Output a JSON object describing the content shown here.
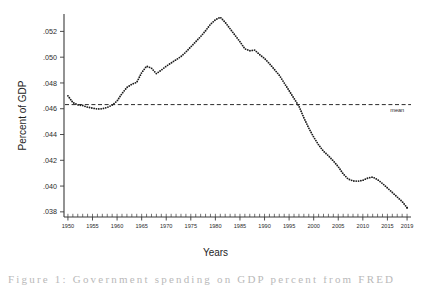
{
  "chart_data": {
    "type": "scatter",
    "title": "",
    "xlabel": "Years",
    "ylabel": "Percent of GDP",
    "xlim": [
      1949.2,
      2019.8
    ],
    "ylim": [
      0.0376,
      0.05335
    ],
    "grid": false,
    "legend": "none",
    "marker_style": "dotted-line",
    "x_tick_labels": [
      "1950",
      "1955",
      "1960",
      "1965",
      "1970",
      "1975",
      "1980",
      "1985",
      "1990",
      "1995",
      "2000",
      "2005",
      "2010",
      "2015",
      "2019"
    ],
    "x_tick_values": [
      1950,
      1955,
      1960,
      1965,
      1970,
      1975,
      1980,
      1985,
      1990,
      1995,
      2000,
      2005,
      2010,
      2015,
      2019
    ],
    "x_minor_tick_step": 1,
    "y_tick_labels": [
      ".038",
      ".040",
      ".042",
      ".044",
      ".046",
      ".048",
      ".050",
      ".052"
    ],
    "y_tick_values": [
      0.038,
      0.04,
      0.042,
      0.044,
      0.046,
      0.048,
      0.05,
      0.052
    ],
    "annotations": [
      {
        "name": "mean",
        "label": "mean",
        "type": "hline",
        "value": 0.04632,
        "x_label_pos": 2017
      }
    ],
    "series": [
      {
        "name": "Percent of GDP",
        "x": [
          1950,
          1951,
          1952,
          1953,
          1954,
          1955,
          1956,
          1957,
          1958,
          1959,
          1960,
          1961,
          1962,
          1963,
          1964,
          1965,
          1966,
          1967,
          1968,
          1969,
          1970,
          1971,
          1972,
          1973,
          1974,
          1975,
          1976,
          1977,
          1978,
          1979,
          1980,
          1981,
          1982,
          1983,
          1984,
          1985,
          1986,
          1987,
          1988,
          1989,
          1990,
          1991,
          1992,
          1993,
          1994,
          1995,
          1996,
          1997,
          1998,
          1999,
          2000,
          2001,
          2002,
          2003,
          2004,
          2005,
          2006,
          2007,
          2008,
          2009,
          2010,
          2011,
          2012,
          2013,
          2014,
          2015,
          2016,
          2017,
          2018,
          2019
        ],
        "values": [
          0.047,
          0.04648,
          0.0463,
          0.04625,
          0.04612,
          0.04605,
          0.04598,
          0.046,
          0.0461,
          0.04628,
          0.0466,
          0.04718,
          0.04765,
          0.0479,
          0.04805,
          0.0488,
          0.0493,
          0.04915,
          0.04872,
          0.049,
          0.0493,
          0.04955,
          0.0498,
          0.05005,
          0.0504,
          0.0508,
          0.0512,
          0.0516,
          0.05205,
          0.05255,
          0.0529,
          0.0531,
          0.0527,
          0.0522,
          0.0517,
          0.0512,
          0.05065,
          0.0505,
          0.05055,
          0.0502,
          0.0499,
          0.0495,
          0.04905,
          0.0486,
          0.048,
          0.0474,
          0.0468,
          0.0462,
          0.0453,
          0.0445,
          0.0438,
          0.0432,
          0.0427,
          0.04235,
          0.04195,
          0.0415,
          0.04095,
          0.04055,
          0.0404,
          0.04038,
          0.04045,
          0.04062,
          0.0407,
          0.0405,
          0.0402,
          0.03985,
          0.0395,
          0.03915,
          0.0388,
          0.03832
        ]
      }
    ]
  },
  "figure": {
    "y_axis_title": "Percent of GDP",
    "x_axis_title": "Years",
    "mean_label": "mean",
    "caption_fragment": "Figure 1: Government spending on GDP percent from FRED"
  }
}
